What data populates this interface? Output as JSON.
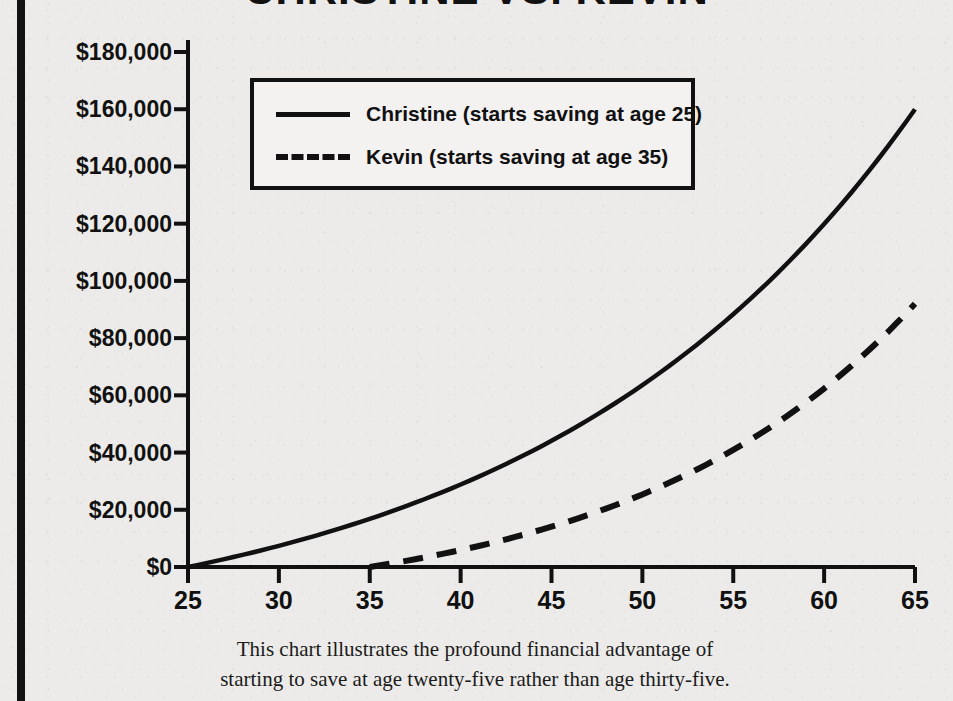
{
  "page": {
    "title": "CHRISTINE VS. KEVIN",
    "background_color": "#ecebe9",
    "ink_color": "#111111"
  },
  "caption": {
    "line1": "This chart illustrates the profound financial advantage of",
    "line2": "starting to save at age twenty-five rather than age thirty-five."
  },
  "legend": {
    "entries": [
      {
        "label": "Christine (starts saving at age 25)",
        "style": "solid"
      },
      {
        "label": "Kevin (starts saving at age 35)",
        "style": "dashed"
      }
    ]
  },
  "chart_data": {
    "type": "line",
    "title": "CHRISTINE VS. KEVIN",
    "xlabel": "",
    "ylabel": "",
    "xlim": [
      25,
      65
    ],
    "ylim": [
      0,
      180000
    ],
    "grid": false,
    "legend_position": "upper-left-inside",
    "x_tick_labels": [
      "25",
      "30",
      "35",
      "40",
      "45",
      "50",
      "55",
      "60",
      "65"
    ],
    "x_ticks": [
      25,
      30,
      35,
      40,
      45,
      50,
      55,
      60,
      65
    ],
    "y_tick_labels": [
      "$0",
      "$20,000",
      "$40,000",
      "$60,000",
      "$80,000",
      "$100,000",
      "$120,000",
      "$140,000",
      "$160,000",
      "$180,000"
    ],
    "y_ticks": [
      0,
      20000,
      40000,
      60000,
      80000,
      100000,
      120000,
      140000,
      160000,
      180000
    ],
    "x": [
      25,
      26,
      27,
      28,
      29,
      30,
      31,
      32,
      33,
      34,
      35,
      36,
      37,
      38,
      39,
      40,
      41,
      42,
      43,
      44,
      45,
      46,
      47,
      48,
      49,
      50,
      51,
      52,
      53,
      54,
      55,
      56,
      57,
      58,
      59,
      60,
      61,
      62,
      63,
      64,
      65
    ],
    "series": [
      {
        "name": "Christine (starts saving at age 25)",
        "style": "solid",
        "values": [
          0,
          1250,
          2600,
          4060,
          5630,
          7330,
          9160,
          11140,
          13270,
          15570,
          18050,
          20720,
          23600,
          26700,
          30050,
          33660,
          37550,
          41750,
          46280,
          51170,
          56440,
          62130,
          68270,
          74890,
          82040,
          89750,
          98070,
          107050,
          116740,
          127200,
          138490,
          150670,
          163820,
          178010,
          193330,
          209860,
          227710,
          246980,
          267780,
          290240,
          160000
        ]
      },
      {
        "name": "Kevin (starts saving at age 35)",
        "style": "dashed",
        "values": [
          0,
          0,
          0,
          0,
          0,
          0,
          0,
          0,
          0,
          0,
          0,
          1250,
          2600,
          4060,
          5630,
          7330,
          9160,
          11140,
          13270,
          15570,
          18050,
          20720,
          23600,
          26700,
          30050,
          33660,
          37550,
          41750,
          46280,
          51170,
          56440,
          62130,
          68270,
          74890,
          82040,
          89750,
          98070,
          107050,
          116740,
          127200,
          92000
        ]
      }
    ],
    "endpoint_values": {
      "christine_at_65": 160000,
      "kevin_at_65": 92000
    }
  }
}
